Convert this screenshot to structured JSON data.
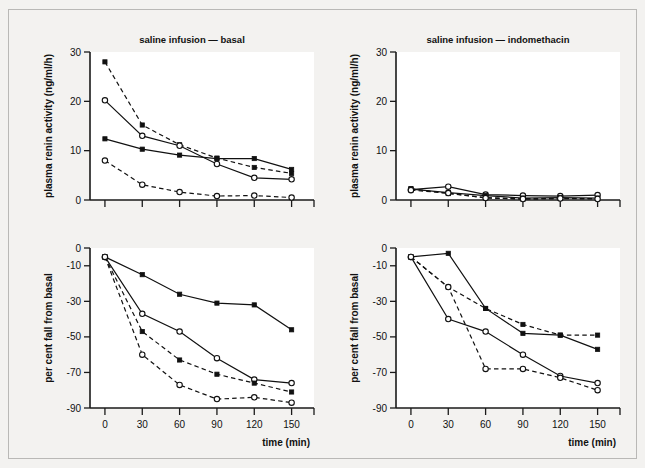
{
  "figure": {
    "background": "#f3f2f0",
    "plot_background": "#ffffff",
    "ink": "#111111",
    "border": "#b9b8b6"
  },
  "axis_titles": {
    "pra": "plasma renin activity (ng/ml/h)",
    "fall": "per cent fall from basal",
    "time": "time (min)"
  },
  "titles": {
    "left": "saline infusion — basal",
    "right": "saline infusion — indomethacin"
  },
  "ticks": {
    "time_labels": [
      "0",
      "30",
      "60",
      "90",
      "120",
      "150"
    ],
    "time_values": [
      0,
      30,
      60,
      90,
      120,
      150
    ],
    "pra_labels": [
      "0",
      "10",
      "20",
      "30"
    ],
    "pra_values": [
      0,
      10,
      20,
      30
    ],
    "fall_labels": [
      "0",
      "-10",
      "-30",
      "-50",
      "-70",
      "-90"
    ],
    "fall_values": [
      0,
      -10,
      -30,
      -50,
      -70,
      -90
    ]
  },
  "chart_data": [
    {
      "id": "top-left",
      "type": "line",
      "title": "saline infusion — basal",
      "xlabel": "",
      "ylabel": "plasma renin activity (ng/ml/h)",
      "x": [
        0,
        30,
        60,
        90,
        120,
        150
      ],
      "xlim": [
        -12,
        168
      ],
      "ylim": [
        0,
        30
      ],
      "grid": false,
      "legend": "none",
      "series": [
        {
          "name": "filled-dashed",
          "marker": "filled-square",
          "line": "dashed",
          "values": [
            28.0,
            15.2,
            11.2,
            8.5,
            6.6,
            5.4
          ]
        },
        {
          "name": "open-solid",
          "marker": "open-circle",
          "line": "solid",
          "values": [
            20.2,
            13.0,
            11.0,
            7.3,
            4.5,
            4.2
          ]
        },
        {
          "name": "filled-solid",
          "marker": "filled-square",
          "line": "solid",
          "values": [
            12.4,
            10.3,
            9.1,
            8.4,
            8.4,
            6.2
          ]
        },
        {
          "name": "open-dashed",
          "marker": "open-circle",
          "line": "dashed",
          "values": [
            8.0,
            3.1,
            1.6,
            0.8,
            0.9,
            0.5
          ]
        }
      ]
    },
    {
      "id": "top-right",
      "type": "line",
      "title": "saline infusion — indomethacin",
      "xlabel": "",
      "ylabel": "plasma renin activity (ng/ml/h)",
      "x": [
        0,
        30,
        60,
        90,
        120,
        150
      ],
      "xlim": [
        -12,
        168
      ],
      "ylim": [
        0,
        30
      ],
      "grid": false,
      "legend": "none",
      "series": [
        {
          "name": "filled-dashed",
          "marker": "filled-square",
          "line": "dashed",
          "values": [
            2.3,
            1.3,
            0.5,
            0.2,
            0.3,
            0.3
          ]
        },
        {
          "name": "open-solid",
          "marker": "open-circle",
          "line": "solid",
          "values": [
            2.1,
            2.7,
            1.1,
            0.9,
            0.8,
            1.0
          ]
        },
        {
          "name": "filled-solid",
          "marker": "filled-square",
          "line": "solid",
          "values": [
            2.2,
            1.5,
            0.9,
            0.4,
            0.5,
            0.4
          ]
        },
        {
          "name": "open-dashed",
          "marker": "open-circle",
          "line": "dashed",
          "values": [
            2.0,
            1.4,
            0.4,
            0.2,
            0.3,
            0.2
          ]
        }
      ]
    },
    {
      "id": "bottom-left",
      "type": "line",
      "title": "",
      "xlabel": "time (min)",
      "ylabel": "per cent fall from basal",
      "x": [
        0,
        30,
        60,
        90,
        120,
        150
      ],
      "xlim": [
        -12,
        168
      ],
      "ylim": [
        -90,
        0
      ],
      "grid": false,
      "legend": "none",
      "series": [
        {
          "name": "filled-solid",
          "marker": "filled-square",
          "line": "solid",
          "values": [
            -5,
            -15,
            -26,
            -31,
            -32,
            -46
          ]
        },
        {
          "name": "open-solid",
          "marker": "open-circle",
          "line": "solid",
          "values": [
            -5,
            -37,
            -47,
            -62,
            -74,
            -76
          ]
        },
        {
          "name": "filled-dashed",
          "marker": "filled-square",
          "line": "dashed",
          "values": [
            -5,
            -47,
            -63,
            -71,
            -76,
            -81
          ]
        },
        {
          "name": "open-dashed",
          "marker": "open-circle",
          "line": "dashed",
          "values": [
            -5,
            -60,
            -77,
            -85,
            -84,
            -87
          ]
        }
      ]
    },
    {
      "id": "bottom-right",
      "type": "line",
      "title": "",
      "xlabel": "time (min)",
      "ylabel": "per cent fall from basal",
      "x": [
        0,
        30,
        60,
        90,
        120,
        150
      ],
      "xlim": [
        -12,
        168
      ],
      "ylim": [
        -90,
        0
      ],
      "grid": false,
      "legend": "none",
      "series": [
        {
          "name": "filled-solid",
          "marker": "filled-square",
          "line": "solid",
          "values": [
            -5,
            -3,
            -34,
            -48,
            -49,
            -57
          ]
        },
        {
          "name": "filled-dashed",
          "marker": "filled-square",
          "line": "dashed",
          "values": [
            -5,
            -22,
            -34,
            -43,
            -49,
            -49
          ]
        },
        {
          "name": "open-solid",
          "marker": "open-circle",
          "line": "solid",
          "values": [
            -5,
            -40,
            -47,
            -60,
            -72,
            -76
          ]
        },
        {
          "name": "open-dashed",
          "marker": "open-circle",
          "line": "dashed",
          "values": [
            -5,
            -22,
            -68,
            -68,
            -73,
            -80
          ]
        }
      ]
    }
  ]
}
